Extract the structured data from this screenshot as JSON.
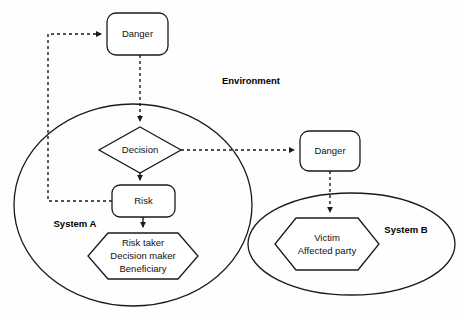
{
  "diagram": {
    "background_color": "#fefefe",
    "stroke_color": "#1a1a1a",
    "regions": [
      {
        "id": "environment",
        "label": "Environment",
        "shape": "implicit"
      },
      {
        "id": "system_a",
        "label": "System A",
        "shape": "ellipse"
      },
      {
        "id": "system_b",
        "label": "System B",
        "shape": "ellipse"
      }
    ],
    "nodes": [
      {
        "id": "danger_top",
        "label": "Danger",
        "shape": "rounded-rectangle"
      },
      {
        "id": "decision",
        "label": "Decision",
        "shape": "diamond"
      },
      {
        "id": "risk",
        "label": "Risk",
        "shape": "rounded-rectangle"
      },
      {
        "id": "actors",
        "shape": "hexagon",
        "label_line1": "Risk taker",
        "label_line2": "Decision maker",
        "label_line3": "Beneficiary"
      },
      {
        "id": "danger_right",
        "label": "Danger",
        "shape": "rounded-rectangle"
      },
      {
        "id": "victim",
        "shape": "hexagon",
        "label_line1": "Victim",
        "label_line2": "Affected party"
      }
    ],
    "edges": [
      {
        "id": "risk-to-danger-top",
        "from": "risk",
        "to": "danger_top",
        "style": "dashed",
        "arrow": true
      },
      {
        "id": "danger-top-to-decision",
        "from": "danger_top",
        "to": "decision",
        "style": "dashed",
        "arrow": true
      },
      {
        "id": "decision-to-risk",
        "from": "decision",
        "to": "risk",
        "style": "solid",
        "arrow": true
      },
      {
        "id": "risk-to-actors",
        "from": "risk",
        "to": "actors",
        "style": "solid",
        "arrow": true
      },
      {
        "id": "decision-to-danger-right",
        "from": "decision",
        "to": "danger_right",
        "style": "dashed",
        "arrow": true
      },
      {
        "id": "danger-right-to-victim",
        "from": "danger_right",
        "to": "victim",
        "style": "dashed",
        "arrow": true
      }
    ]
  }
}
